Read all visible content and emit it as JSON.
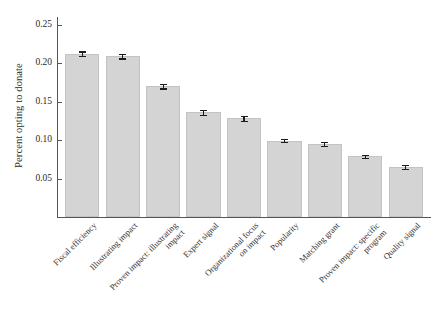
{
  "chart_data": {
    "type": "bar",
    "title": "",
    "subtitle": "",
    "xlabel": "",
    "ylabel": "Percent opting to donate",
    "ylim": [
      0.0,
      0.26
    ],
    "ytick_labels": [
      "0.05",
      "0.10",
      "0.15",
      "0.20",
      "0.25"
    ],
    "ytick_values": [
      0.05,
      0.1,
      0.15,
      0.2,
      0.25
    ],
    "grid": false,
    "legend": null,
    "bar_color": "#d4d4d4",
    "error_color": "#1c1c1c",
    "axis_color": "#555555",
    "categories": [
      "Fiscal efficiency",
      "Illustrating impact",
      "Proven impact: illustrating\nimpact",
      "Expert signal",
      "Organizational focus\non impact",
      "Popularity",
      "Matching grant",
      "Proven impact: specific\nprogram",
      "Quality signal"
    ],
    "values": [
      0.212,
      0.209,
      0.17,
      0.136,
      0.128,
      0.099,
      0.095,
      0.079,
      0.065
    ],
    "errors": [
      0.003,
      0.003,
      0.003,
      0.003,
      0.003,
      0.002,
      0.003,
      0.002,
      0.003
    ]
  }
}
